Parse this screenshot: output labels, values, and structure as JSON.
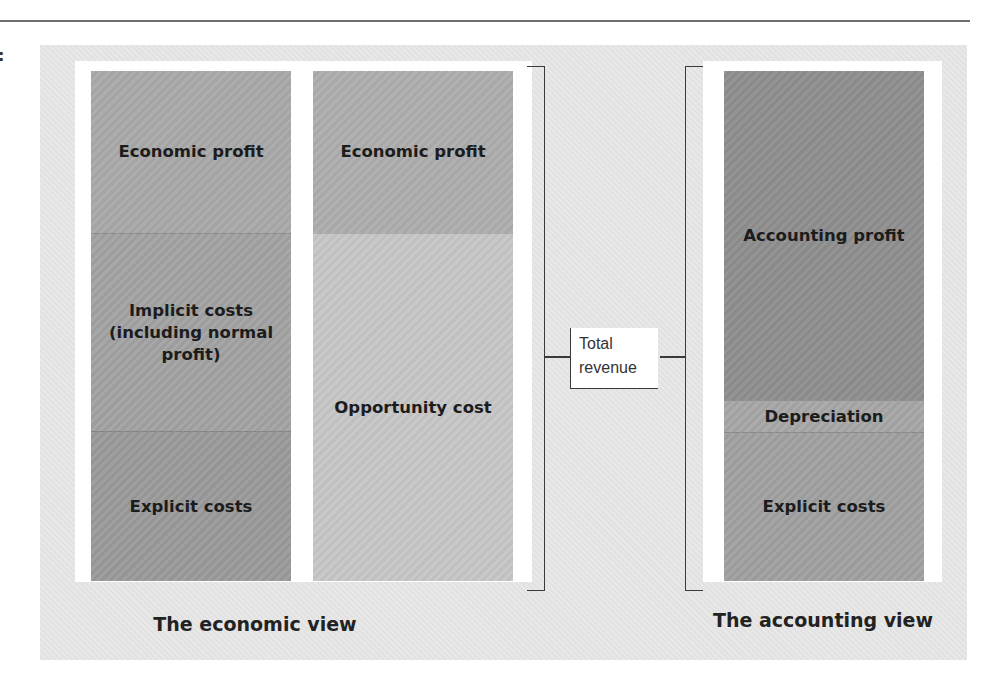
{
  "page": {
    "stray_mark": ":"
  },
  "diagram": {
    "colors": {
      "panel": "#e6e6e6",
      "frame": "#ffffff",
      "line": "#3a3a3a"
    },
    "economic_view": {
      "caption": "The economic view",
      "columns": [
        {
          "id": "economic-breakdown",
          "blocks": [
            {
              "label": "Economic profit",
              "top": 0,
              "height": 162,
              "color": "#a9a9a9"
            },
            {
              "label": "Implicit costs (including normal profit)",
              "top": 162,
              "height": 198,
              "color": "#a2a2a2"
            },
            {
              "label": "Explicit costs",
              "top": 360,
              "height": 150,
              "color": "#9a9a9a"
            }
          ]
        },
        {
          "id": "opportunity-breakdown",
          "blocks": [
            {
              "label": "Economic profit",
              "top": 0,
              "height": 162,
              "color": "#adadad"
            },
            {
              "label": "Opportunity cost",
              "top": 162,
              "height": 348,
              "color": "#c6c6c6"
            }
          ]
        }
      ]
    },
    "total_revenue": {
      "line1": "Total",
      "line2": "revenue"
    },
    "accounting_view": {
      "caption": "The accounting view",
      "columns": [
        {
          "id": "accounting-breakdown",
          "blocks": [
            {
              "label": "Accounting profit",
              "top": 0,
              "height": 329,
              "color": "#8e8e8e"
            },
            {
              "label": "Depreciation",
              "top": 329,
              "height": 32,
              "color": "#a6a6a6"
            },
            {
              "label": "Explicit costs",
              "top": 361,
              "height": 149,
              "color": "#a0a0a0"
            }
          ]
        }
      ]
    }
  }
}
